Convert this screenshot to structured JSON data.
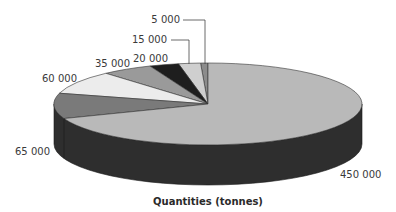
{
  "chart_data": {
    "type": "pie",
    "style": "3d",
    "title": "Quantities (tonnes)",
    "categories": [
      "5 000",
      "15 000",
      "20 000",
      "35 000",
      "60 000",
      "65 000",
      "450 000"
    ],
    "values": [
      5000,
      15000,
      20000,
      35000,
      60000,
      65000,
      450000
    ],
    "labels": [
      "5 000",
      "15 000",
      "20 000",
      "35 000",
      "60 000",
      "65 000",
      "450 000"
    ],
    "colors": [
      "#8c8c8c",
      "#cfcfcf",
      "#1e1e1e",
      "#9a9a9a",
      "#ececec",
      "#7a7a7a",
      "#b9b9b9"
    ],
    "side_color": "#2e2e2e",
    "legend": "none",
    "xlabel": "Quantities (tonnes)"
  }
}
